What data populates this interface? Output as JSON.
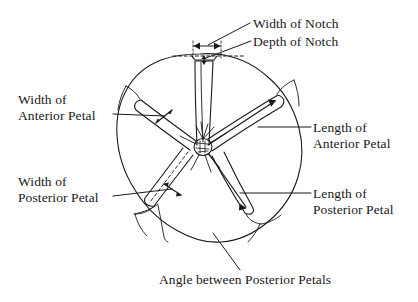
{
  "figure": {
    "kind": "anatomical-line-diagram",
    "stroke_color": "#1a1a1a",
    "background_color": "#ffffff",
    "text_color": "#18181a"
  },
  "labels": {
    "width_of_notch": {
      "line1": "Width of Notch"
    },
    "depth_of_notch": {
      "line1": "Depth of Notch"
    },
    "width_of_anterior_petal": {
      "line1": "Width of",
      "line2": "Anterior Petal"
    },
    "width_of_posterior_petal": {
      "line1": "Width of",
      "line2": "Posterior Petal"
    },
    "length_of_anterior_petal": {
      "line1": "Length of",
      "line2": "Anterior Petal"
    },
    "length_of_posterior_petal": {
      "line1": "Length of",
      "line2": "Posterior Petal"
    },
    "angle_between_posterior_petals": {
      "line1": "Angle between Posterior Petals"
    }
  },
  "measurements": [
    {
      "name": "Width of Notch",
      "marker": "horizontal double-headed arrow at top of notch"
    },
    {
      "name": "Depth of Notch",
      "marker": "short vertical double-headed arrow below dashed chord"
    },
    {
      "name": "Width of Anterior Petal",
      "marker": "short double-headed arrow across upper-left petal"
    },
    {
      "name": "Width of Posterior Petal",
      "marker": "short double-headed arrow across lower-left petal"
    },
    {
      "name": "Length of Anterior Petal",
      "marker": "long arrow from hub to upper-right petal tip"
    },
    {
      "name": "Length of Posterior Petal",
      "marker": "long arrow from hub to lower-right petal tip"
    },
    {
      "name": "Angle between Posterior Petals",
      "marker": "angle vertex at central hub between the two posterior petals"
    }
  ]
}
